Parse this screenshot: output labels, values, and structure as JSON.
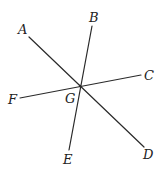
{
  "diagram": {
    "type": "intersecting-lines",
    "intersection": {
      "name": "G",
      "x": 80,
      "y": 86
    },
    "lines": [
      {
        "id": "AD",
        "from": "A",
        "to": "D",
        "x1": 29,
        "y1": 37,
        "x2": 144,
        "y2": 147
      },
      {
        "id": "BE",
        "from": "B",
        "to": "E",
        "x1": 92,
        "y1": 26,
        "x2": 69,
        "y2": 150
      },
      {
        "id": "CF",
        "from": "C",
        "to": "F",
        "x1": 141,
        "y1": 75,
        "x2": 20,
        "y2": 98
      }
    ],
    "labels": {
      "A": "A",
      "B": "B",
      "C": "C",
      "D": "D",
      "E": "E",
      "F": "F",
      "G": "G"
    },
    "stroke_color": "#2a2a2a",
    "label_color": "#222222"
  }
}
